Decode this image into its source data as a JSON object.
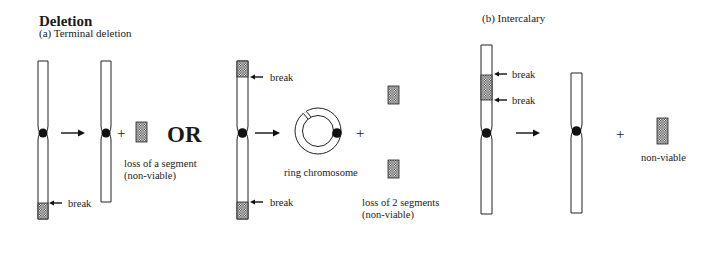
{
  "title": "Deletion",
  "sections": {
    "terminal": {
      "subtitle": "(a) Terminal deletion",
      "option1": {
        "break_label": "break",
        "plus": "+",
        "loss_label_line1": "loss of a segment",
        "loss_label_line2": "(non-viable)"
      },
      "or_label": "OR",
      "option2": {
        "break_top_label": "break",
        "break_bottom_label": "break",
        "ring_label": "ring chromosome",
        "plus": "+",
        "loss_label_line1": "loss of 2 segments",
        "loss_label_line2": "(non-viable)"
      }
    },
    "intercalary": {
      "subtitle": "(b) Intercalary",
      "break_top_label": "break",
      "break_bottom_label": "break",
      "plus": "+",
      "loss_label": "non-viable"
    }
  },
  "colors": {
    "line": "#222222",
    "centromere": "#111111",
    "shade_dot": "#333333",
    "background": "#ffffff"
  }
}
